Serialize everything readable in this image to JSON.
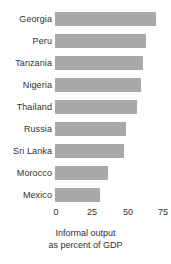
{
  "chart_data": {
    "type": "bar",
    "orientation": "horizontal",
    "title": "",
    "subtitle": "",
    "categories": [
      "Georgia",
      "Peru",
      "Tanzania",
      "Nigeria",
      "Thailand",
      "Russia",
      "Sri Lanka",
      "Morocco",
      "Mexico"
    ],
    "values": [
      70,
      63,
      61,
      60,
      57,
      49,
      48,
      37,
      31
    ],
    "xlabel": "Informal output as percent of GDP",
    "ylabel": "",
    "xlim": [
      0,
      75
    ],
    "xticks": [
      0,
      25,
      50,
      75
    ],
    "xtick_labels": [
      "0",
      "25",
      "50",
      "75"
    ],
    "grid": false,
    "legend": null,
    "bar_color": "#a9a9a9",
    "text_color": "#2f2f2f",
    "background": "#ffffff",
    "caption_line1": "Informal output",
    "caption_line2": "as percent of GDP"
  }
}
